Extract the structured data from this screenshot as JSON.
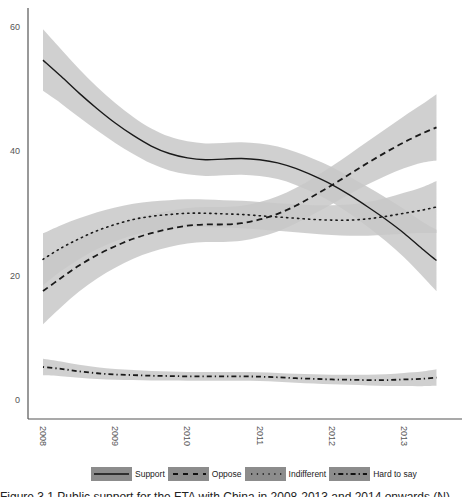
{
  "chart_data": {
    "type": "line",
    "title": "",
    "xlabel": "",
    "ylabel": "",
    "x_ticks": [
      "2008",
      "2009",
      "2010",
      "2011",
      "2012",
      "2013"
    ],
    "y_ticks": [
      "0",
      "20",
      "40",
      "60"
    ],
    "ylim": [
      -2,
      64
    ],
    "xlim": [
      2007.8,
      2013.75
    ],
    "grid": false,
    "legend_position": "bottom",
    "confidence_band": true,
    "x": [
      2008.0,
      2008.25,
      2008.5,
      2008.75,
      2009.0,
      2009.25,
      2009.5,
      2009.75,
      2010.0,
      2010.25,
      2010.5,
      2010.75,
      2011.0,
      2011.25,
      2011.5,
      2011.75,
      2012.0,
      2012.25,
      2012.5,
      2012.75,
      2013.0,
      2013.25,
      2013.45
    ],
    "series": [
      {
        "name": "Support",
        "style": "solid",
        "band": 2.6,
        "values": [
          54.6,
          52.0,
          49.3,
          46.8,
          44.5,
          42.5,
          40.8,
          39.6,
          38.9,
          38.6,
          38.7,
          38.8,
          38.6,
          38.1,
          37.2,
          36.0,
          34.6,
          32.9,
          31.0,
          29.0,
          26.8,
          24.3,
          22.4
        ]
      },
      {
        "name": "Oppose",
        "style": "dashed",
        "band": 2.8,
        "values": [
          17.5,
          19.6,
          21.6,
          23.3,
          24.7,
          25.9,
          26.8,
          27.5,
          28.0,
          28.2,
          28.2,
          28.4,
          29.0,
          29.9,
          31.2,
          32.8,
          34.5,
          36.3,
          38.1,
          39.8,
          41.4,
          42.8,
          43.8
        ]
      },
      {
        "name": "Indifferent",
        "style": "dotted",
        "band": 2.2,
        "values": [
          22.6,
          24.4,
          25.9,
          27.2,
          28.2,
          29.0,
          29.5,
          29.8,
          30.0,
          30.0,
          29.9,
          29.8,
          29.6,
          29.4,
          29.2,
          29.0,
          28.9,
          28.9,
          29.1,
          29.5,
          30.0,
          30.5,
          31.0
        ]
      },
      {
        "name": "Hard to say",
        "style": "dashdot",
        "band": 0.7,
        "values": [
          5.3,
          5.0,
          4.6,
          4.3,
          4.1,
          4.0,
          3.9,
          3.85,
          3.8,
          3.8,
          3.8,
          3.8,
          3.75,
          3.65,
          3.5,
          3.4,
          3.3,
          3.25,
          3.2,
          3.2,
          3.3,
          3.4,
          3.6
        ]
      }
    ]
  },
  "legend": {
    "items": [
      {
        "label": "Support"
      },
      {
        "label": "Oppose"
      },
      {
        "label": "Indifferent"
      },
      {
        "label": "Hard to say"
      }
    ]
  },
  "colors": {
    "line": "#1a1a1a",
    "band": "#c8c8c8",
    "axis": "#555555",
    "legend_swatch": "#8c8c8c"
  },
  "caption": {
    "text": "Figure 3.1 Public support for the FTA with China in 2008-2013 and 2014 onwards (N)"
  }
}
